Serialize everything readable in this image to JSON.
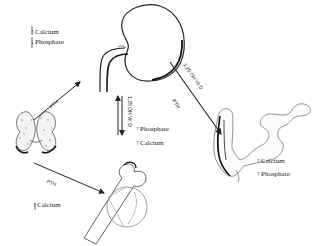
{
  "diagram": {
    "title": "",
    "organs": [
      "kidney",
      "parathyroid",
      "bone",
      "intestine"
    ],
    "kidney_effects": {
      "items": [
        {
          "arrow": "↑",
          "label": "Calcium"
        },
        {
          "arrow": "↓",
          "label": "Phosphate"
        }
      ]
    },
    "kidney_output": {
      "hormone": "1,25 OH Vit D",
      "items": [
        {
          "arrow": "↑",
          "label": "Phosphate"
        },
        {
          "arrow": "↑",
          "label": "Calcium"
        }
      ]
    },
    "parathyroid_to_kidney": {
      "label": "PTH"
    },
    "parathyroid_to_bone": {
      "label": "PTH"
    },
    "bone_effects": {
      "items": [
        {
          "arrow": "↑",
          "label": "Calcium"
        }
      ]
    },
    "kidney_to_intestine": {
      "upper_label": "1,25 OH Vit D",
      "lower_label": "PTH"
    },
    "intestine_effects": {
      "items": [
        {
          "arrow": "↑",
          "label": "Calcium"
        },
        {
          "arrow": "↑",
          "label": "Phosphate"
        }
      ]
    }
  }
}
